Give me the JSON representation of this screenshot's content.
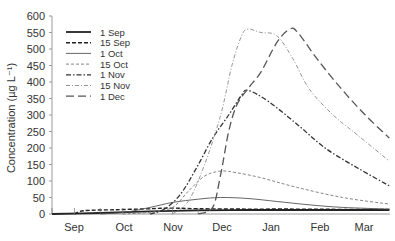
{
  "chart_data": {
    "type": "line",
    "title": "",
    "xlabel": "",
    "ylabel": "Concentration (µg L⁻¹)",
    "ylim": [
      0,
      600
    ],
    "yticks": [
      0,
      50,
      100,
      150,
      200,
      250,
      300,
      350,
      400,
      450,
      500,
      550,
      600
    ],
    "xticks": [
      "Sep",
      "Oct",
      "Nov",
      "Dec",
      "Jan",
      "Feb",
      "Mar"
    ],
    "x_unit": "days since 1 Sep",
    "grid": false,
    "legend_position": "upper-left",
    "series": [
      {
        "name": "1 Sep",
        "style": "solid-thick",
        "color": "#222222",
        "x": [
          0,
          30,
          61,
          91,
          122,
          153,
          181,
          210
        ],
        "values": [
          0,
          3,
          8,
          11,
          12,
          12,
          12,
          12
        ]
      },
      {
        "name": "15 Sep",
        "style": "dashed",
        "color": "#222222",
        "x": [
          14,
          20,
          40,
          61,
          75,
          91,
          122,
          153,
          181,
          210
        ],
        "values": [
          0,
          10,
          13,
          16,
          18,
          16,
          15,
          15,
          14,
          14
        ]
      },
      {
        "name": "1 Oct",
        "style": "solid-thin",
        "color": "#555555",
        "x": [
          30,
          45,
          61,
          75,
          91,
          105,
          122,
          140,
          160,
          181,
          210
        ],
        "values": [
          0,
          5,
          20,
          35,
          45,
          50,
          47,
          38,
          28,
          20,
          15
        ]
      },
      {
        "name": "15 Oct",
        "style": "dashed-thin",
        "color": "#777777",
        "x": [
          44,
          61,
          75,
          85,
          95,
          105,
          115,
          130,
          153,
          181,
          210
        ],
        "values": [
          0,
          5,
          20,
          70,
          115,
          130,
          125,
          110,
          80,
          50,
          30
        ]
      },
      {
        "name": "1 Nov",
        "style": "dash-dot",
        "color": "#333333",
        "x": [
          61,
          70,
          80,
          90,
          100,
          110,
          118,
          122,
          135,
          153,
          170,
          190,
          210
        ],
        "values": [
          0,
          15,
          60,
          140,
          230,
          300,
          360,
          375,
          340,
          270,
          200,
          140,
          85
        ]
      },
      {
        "name": "15 Nov",
        "style": "dash-dot-thin",
        "color": "#888888",
        "x": [
          75,
          85,
          95,
          105,
          112,
          118,
          122,
          130,
          140,
          150,
          160,
          175,
          190,
          210
        ],
        "values": [
          0,
          40,
          150,
          300,
          450,
          540,
          560,
          550,
          540,
          470,
          380,
          300,
          240,
          160
        ]
      },
      {
        "name": "1 Dec",
        "style": "long-dash",
        "color": "#555555",
        "x": [
          91,
          100,
          105,
          110,
          115,
          122,
          130,
          140,
          148,
          153,
          165,
          180,
          195,
          210
        ],
        "values": [
          0,
          20,
          120,
          250,
          330,
          380,
          430,
          520,
          560,
          550,
          470,
          380,
          300,
          230
        ]
      }
    ]
  },
  "legend": {
    "items": [
      "1 Sep",
      "15 Sep",
      "1 Oct",
      "15 Oct",
      "1 Nov",
      "15 Nov",
      "1 Dec"
    ]
  },
  "axes": {
    "ylabel": "Concentration (µg L⁻¹)"
  }
}
